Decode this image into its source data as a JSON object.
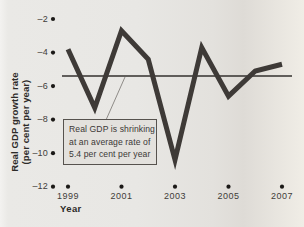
{
  "figure": {
    "y_axis_label_line1": "Real GDP growth rate",
    "y_axis_label_line2": "(per cent per year)",
    "x_axis_label": "Year",
    "annotation": {
      "line1": "Real GDP is shrinking",
      "line2": "at an average rate of",
      "line3": "5.4 per cent per year"
    }
  },
  "chart_data": {
    "type": "line",
    "x": [
      1999,
      2000,
      2001,
      2002,
      2003,
      2004,
      2005,
      2006,
      2007
    ],
    "series": [
      {
        "name": "Real GDP growth rate",
        "values": [
          -3.8,
          -7.3,
          -2.7,
          -4.4,
          -10.4,
          -3.7,
          -6.6,
          -5.1,
          -4.7
        ]
      }
    ],
    "average_line_value": -5.4,
    "ylim": [
      -12,
      -2
    ],
    "xlabel": "Year",
    "ylabel": "Real GDP growth rate (per cent per year)",
    "yticks": [
      {
        "v": -2,
        "label": "–2"
      },
      {
        "v": -4,
        "label": "–4"
      },
      {
        "v": -6,
        "label": "–6"
      },
      {
        "v": -8,
        "label": "–8"
      },
      {
        "v": -10,
        "label": "–10"
      },
      {
        "v": -12,
        "label": "–12"
      }
    ],
    "xticks": [
      {
        "v": 1999,
        "label": "1999"
      },
      {
        "v": 2001,
        "label": "2001"
      },
      {
        "v": 2003,
        "label": "2003"
      },
      {
        "v": 2005,
        "label": "2005"
      },
      {
        "v": 2007,
        "label": "2007"
      }
    ],
    "grid": false,
    "legend": "none",
    "annotation_text": "Real GDP is shrinking at an average rate of 5.4 per cent per year",
    "colors": {
      "line": "#3e3a37",
      "average_line": "#33302e",
      "tick_dot": "#1b1917",
      "leader_line": "#8f8c88",
      "annotation_bg": "#e3e1dd",
      "annotation_border": "#56524e",
      "page_bg": "#e8e7e4"
    }
  }
}
